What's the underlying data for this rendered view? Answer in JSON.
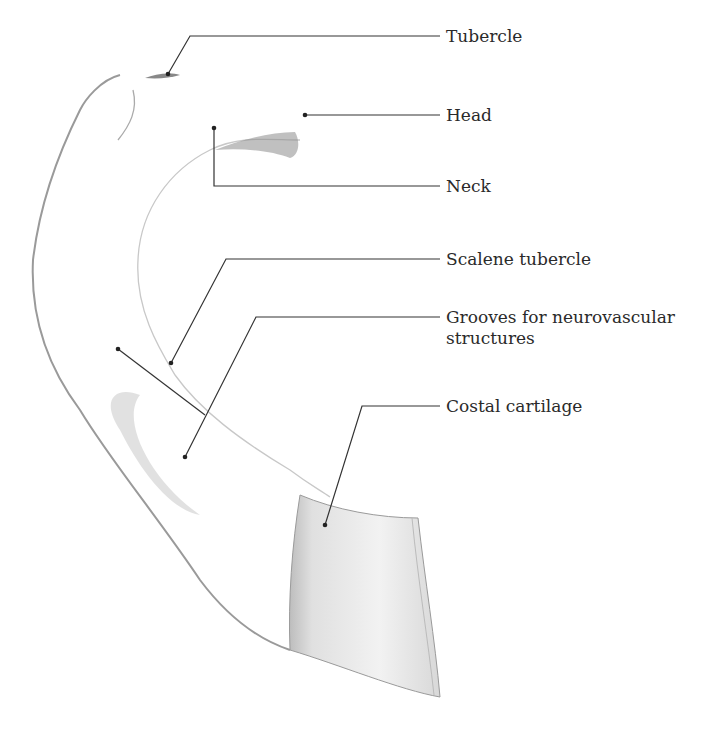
{
  "figure": {
    "labels": [
      {
        "id": "tubercle",
        "text": "Tubercle"
      },
      {
        "id": "head",
        "text": "Head"
      },
      {
        "id": "neck",
        "text": "Neck"
      },
      {
        "id": "scalene-tubercle",
        "text": "Scalene tubercle"
      },
      {
        "id": "grooves",
        "text": "Grooves for neurovascular structures",
        "line1": "Grooves for neurovascular",
        "line2": "structures"
      },
      {
        "id": "costal-cartilage",
        "text": "Costal cartilage"
      }
    ]
  }
}
